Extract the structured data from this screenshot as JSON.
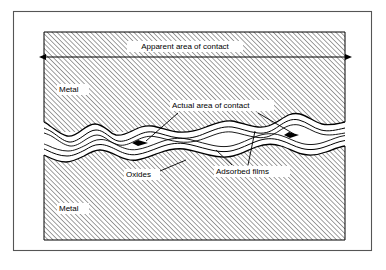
{
  "figure": {
    "frame": {
      "stroke_color": "#555555",
      "background_color": "#ffffff"
    },
    "hatch": {
      "stroke_color": "#444444",
      "angle_degrees": 45,
      "spacing_px": 3.2,
      "description": "diagonal-hatch-fill"
    },
    "line_color": "#000000",
    "labels": {
      "apparent_area": "Apparent area of contact",
      "actual_area": "Actual area of contact",
      "metal_top": "Metal",
      "metal_bottom": "Metal",
      "oxides": "Oxides",
      "adsorbed_films": "Adsorbed films"
    },
    "dimension_arrow": {
      "name": "apparent-area-dimension-arrow",
      "x_start": 46,
      "x_end": 345,
      "y": 57,
      "double_headed": true
    }
  }
}
